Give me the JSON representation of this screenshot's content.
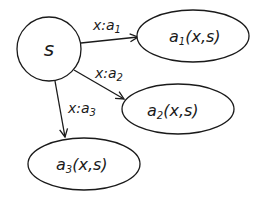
{
  "diagram": {
    "type": "state-transition",
    "nodes": [
      {
        "id": "s",
        "label": "s",
        "shape": "circle"
      },
      {
        "id": "a1",
        "label_main": "a",
        "label_sub": "1",
        "label_args": "(x,s)",
        "shape": "ellipse"
      },
      {
        "id": "a2",
        "label_main": "a",
        "label_sub": "2",
        "label_args": "(x,s)",
        "shape": "ellipse"
      },
      {
        "id": "a3",
        "label_main": "a",
        "label_sub": "3",
        "label_args": "(x,s)",
        "shape": "ellipse"
      }
    ],
    "edges": [
      {
        "from": "s",
        "to": "a1",
        "label_main": "x:a",
        "label_sub": "1"
      },
      {
        "from": "s",
        "to": "a2",
        "label_main": "x:a",
        "label_sub": "2"
      },
      {
        "from": "s",
        "to": "a3",
        "label_main": "x:a",
        "label_sub": "3"
      }
    ],
    "colors": {
      "stroke": "#1a1a1a",
      "background": "#ffffff"
    }
  }
}
